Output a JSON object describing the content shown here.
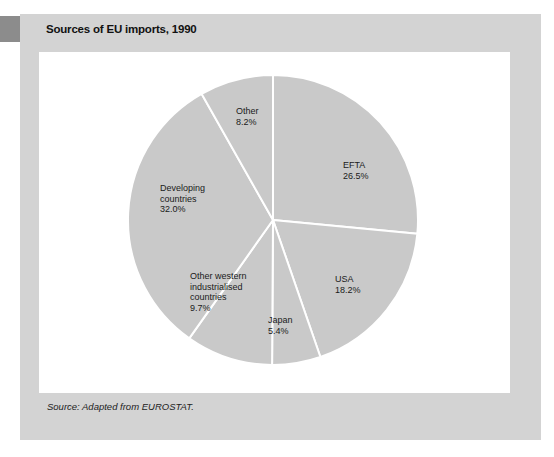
{
  "header": {
    "title": "Sources of EU imports, 1990"
  },
  "footer": {
    "source": "Source: Adapted from EUROSTAT."
  },
  "colors": {
    "panel_bg": "#d3d3d3",
    "accent_block": "#8c8c8c",
    "plot_bg": "#ffffff",
    "slice_fill": "#c9c9c9",
    "slice_divider": "#ffffff",
    "label_text": "#1a1a1a"
  },
  "chart_data": {
    "type": "pie",
    "title": "Sources of EU imports, 1990",
    "source_note": "Source: Adapted from EUROSTAT.",
    "total": 100.0,
    "start_angle_deg": 0,
    "direction": "clockwise",
    "legend_position": "none",
    "labels_inside": true,
    "slice_fill": "#c9c9c9",
    "slice_stroke": "#ffffff",
    "slices": [
      {
        "label": "EFTA",
        "value": 26.5,
        "display": "EFTA\n26.5%"
      },
      {
        "label": "USA",
        "value": 18.2,
        "display": "USA\n18.2%"
      },
      {
        "label": "Japan",
        "value": 5.4,
        "display": "Japan\n5.4%"
      },
      {
        "label": "Other western industrialised countries",
        "value": 9.7,
        "display": "Other western\nindustrialised\ncountries\n9.7%"
      },
      {
        "label": "Developing countries",
        "value": 32.0,
        "display": "Developing\ncountries\n32.0%"
      },
      {
        "label": "Other",
        "value": 8.2,
        "display": "Other\n8.2%"
      }
    ]
  }
}
